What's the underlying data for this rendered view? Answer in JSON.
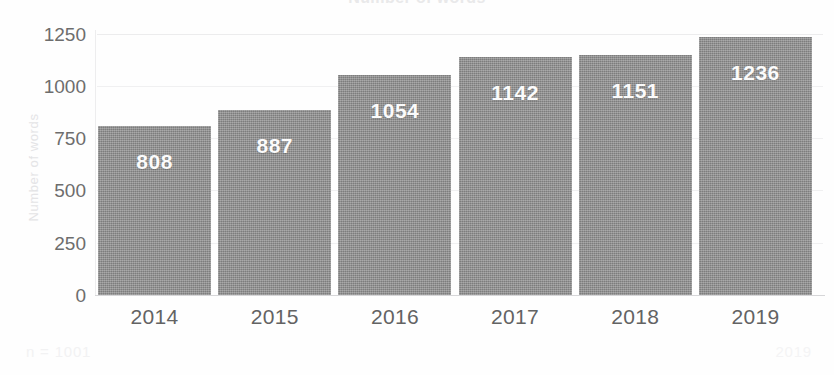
{
  "chart_data": {
    "type": "bar",
    "title": "Number of words",
    "subtitle": "",
    "xlabel": "",
    "ylabel": "Number of words",
    "categories": [
      "2014",
      "2015",
      "2016",
      "2017",
      "2018",
      "2019"
    ],
    "values": [
      808,
      887,
      1054,
      1142,
      1151,
      1236
    ],
    "value_labels": [
      "808",
      "887",
      "1054",
      "1142",
      "1151",
      "1236"
    ],
    "ylim": [
      0,
      1250
    ],
    "yticks": [
      1250,
      1000,
      750,
      500,
      250,
      0
    ],
    "ytick_labels": [
      "1250",
      "1000",
      "750",
      "500",
      "250",
      "0"
    ],
    "grid": true,
    "legend": false,
    "legend_position": "none",
    "bar_color": "#8b8b8b",
    "value_label_color": "#fbfbfb",
    "tick_color": "#6d6d6d",
    "gridline_color": "#f0f0f1"
  },
  "footer": {
    "sample_size": "n = 1001",
    "year_note": "2019"
  }
}
